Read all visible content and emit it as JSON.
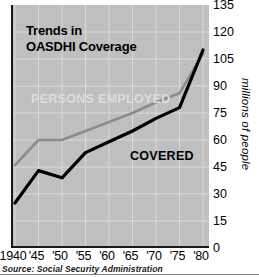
{
  "title": "Trends in\nOASDHI Coverage",
  "source": "Source:  Social Security Administration",
  "yaxis": {
    "title": "millions of people",
    "ticks": [
      "135",
      "120",
      "105",
      "90",
      "75",
      "60",
      "45",
      "30",
      "15",
      "0"
    ]
  },
  "xaxis": {
    "ticks": [
      "1940",
      "'45",
      "'50",
      "'55",
      "'60",
      "'65",
      "'70",
      "'75",
      "'80"
    ]
  },
  "labels": {
    "persons_employed": "PERSONS EMPLOYED",
    "covered": "COVERED"
  },
  "colors": {
    "plot_background": "#bfbfbf",
    "axis": "#1a1a1a",
    "gridline": "#d9d9d9",
    "covered_line": "#000000",
    "persons_employed_line": "#8c8c8c",
    "persons_employed_label": "#dcdcdc"
  },
  "chart_data": {
    "type": "line",
    "title": "Trends in OASDHI Coverage",
    "xlabel": "",
    "ylabel": "millions of people",
    "xlim": [
      1940,
      1980
    ],
    "ylim": [
      0,
      135
    ],
    "ytick_step": 15,
    "grid": true,
    "legend": "inline-labels",
    "x": [
      1940,
      1945,
      1950,
      1955,
      1960,
      1965,
      1970,
      1975,
      1980
    ],
    "series": [
      {
        "name": "PERSONS EMPLOYED",
        "color": "#8c8c8c",
        "values": [
          46,
          60,
          60,
          65,
          70,
          75,
          81,
          86,
          108
        ]
      },
      {
        "name": "COVERED",
        "color": "#000000",
        "values": [
          25,
          43,
          39,
          53,
          59,
          65,
          72,
          78,
          110
        ]
      }
    ],
    "annotations": [
      {
        "text": "PERSONS EMPLOYED",
        "x": 1941.5,
        "y": 88
      },
      {
        "text": "COVERED",
        "x": 1961,
        "y": 55
      }
    ],
    "source": "Source: Social Security Administration"
  }
}
